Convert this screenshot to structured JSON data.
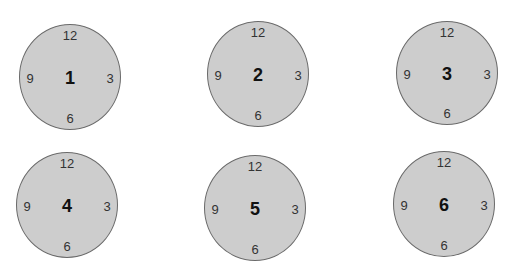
{
  "colors": {
    "face_fill": "#cdcdcd",
    "face_stroke": "#6a6a6a",
    "marker_text": "#333333",
    "center_text": "#111111"
  },
  "clocks": [
    {
      "label": "1",
      "cx": 70,
      "cy": 77,
      "rx": 51,
      "ry": 53,
      "markers": {
        "top": "12",
        "right": "3",
        "bottom": "6",
        "left": "9"
      }
    },
    {
      "label": "2",
      "cx": 258,
      "cy": 74,
      "rx": 51,
      "ry": 53,
      "markers": {
        "top": "12",
        "right": "3",
        "bottom": "6",
        "left": "9"
      }
    },
    {
      "label": "3",
      "cx": 447,
      "cy": 73,
      "rx": 51,
      "ry": 52,
      "markers": {
        "top": "12",
        "right": "3",
        "bottom": "6",
        "left": "9"
      }
    },
    {
      "label": "4",
      "cx": 67,
      "cy": 205,
      "rx": 51,
      "ry": 53,
      "markers": {
        "top": "12",
        "right": "3",
        "bottom": "6",
        "left": "9"
      }
    },
    {
      "label": "5",
      "cx": 255,
      "cy": 208,
      "rx": 51,
      "ry": 53,
      "markers": {
        "top": "12",
        "right": "3",
        "bottom": "6",
        "left": "9"
      }
    },
    {
      "label": "6",
      "cx": 444,
      "cy": 204,
      "rx": 51,
      "ry": 53,
      "markers": {
        "top": "12",
        "right": "3",
        "bottom": "6",
        "left": "9"
      }
    }
  ]
}
